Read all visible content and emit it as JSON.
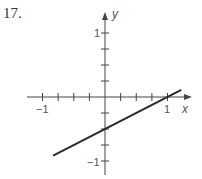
{
  "problem": {
    "number": "17."
  },
  "chart_data": {
    "type": "line",
    "title": "",
    "xlabel": "x",
    "ylabel": "y",
    "xlim": [
      -1.2,
      1.35
    ],
    "ylim": [
      -1.25,
      1.3
    ],
    "grid": false,
    "x_ticks": {
      "step": 0.25,
      "labels": [
        {
          "value": -1,
          "text": "−1"
        },
        {
          "value": 1,
          "text": "1"
        }
      ]
    },
    "y_ticks": {
      "step": 0.25,
      "labels": [
        {
          "value": 1,
          "text": "1"
        },
        {
          "value": -1,
          "text": "−1"
        }
      ]
    },
    "series": [
      {
        "name": "line",
        "equation": "y = 0.5x - 0.5",
        "slope": 0.5,
        "intercept": -0.5,
        "x": [
          -0.83,
          1.22
        ],
        "y": [
          -0.915,
          0.11
        ]
      }
    ],
    "annotations": [
      {
        "type": "x-intercept",
        "point": [
          1,
          0
        ]
      },
      {
        "type": "y-intercept",
        "point": [
          0,
          -0.5
        ]
      }
    ],
    "colors": {
      "axis": "#444444",
      "line": "#2a2a2a",
      "text": "#555555"
    }
  }
}
